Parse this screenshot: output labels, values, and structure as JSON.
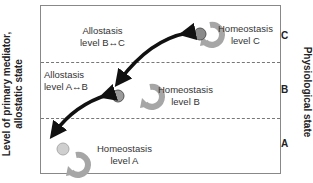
{
  "axes": {
    "left_label_line1": "Level of primary mediator,",
    "left_label_line2": "allostatic state",
    "right_label": "Physiological state"
  },
  "levels": [
    "A",
    "B",
    "C"
  ],
  "labels": {
    "homeostasis_c_1": "Homeostasis",
    "homeostasis_c_2": "level C",
    "homeostasis_b_1": "Homeostasis",
    "homeostasis_b_2": "level B",
    "homeostasis_a_1": "Homeostasis",
    "homeostasis_a_2": "level A",
    "allostasis_bc_1": "Allostasis",
    "allostasis_bc_2": "level B↔C",
    "allostasis_ab_1": "Allostasis",
    "allostasis_ab_2": "level A↔B"
  },
  "colors": {
    "circle_c": "#8a8a8a",
    "circle_b": "#9a9a9a",
    "circle_a": "#cfcfcf",
    "loop": "#a6a6a6",
    "arrow": "#111111"
  }
}
